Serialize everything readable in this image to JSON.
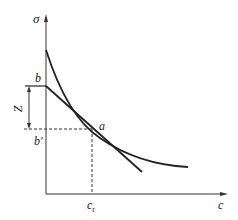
{
  "diagram": {
    "axes": {
      "y_label": "σ",
      "x_label": "c"
    },
    "points": {
      "b": "b",
      "b_prime": "b′",
      "a": "a",
      "c_r_main": "c",
      "c_r_sub": "r"
    },
    "dimension": {
      "label": "Z"
    },
    "colors": {
      "line": "#222222",
      "background": "#ffffff"
    }
  }
}
